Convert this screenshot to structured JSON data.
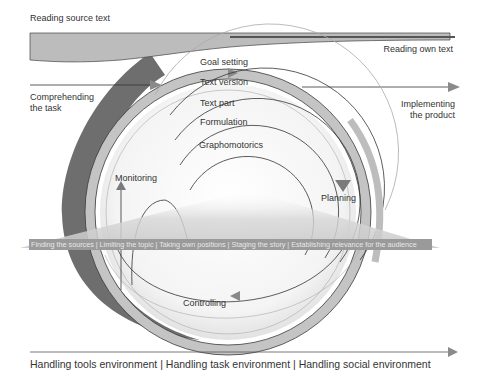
{
  "diagram": {
    "top_left_label": "Reading source text",
    "top_right_label": "Reading own text",
    "left_label": [
      "Comprehending",
      "the task"
    ],
    "right_label": [
      "Implementing",
      "the product"
    ],
    "levels": [
      "Goal setting",
      "Text version",
      "Text part",
      "Formulation",
      "Graphomotorics"
    ],
    "processes": {
      "monitoring": "Monitoring",
      "planning": "Planning",
      "controlling": "Controlling"
    },
    "banner": "Finding the sources | Limiting the topic | Taking own positions | Staging the story | Establishing relevance for the audience",
    "bottom_axis": "Handling tools environment | Handling task environment | Handling social environment",
    "colors": {
      "band_light": "#c4c4c4",
      "band_dark": "#6e6e6e",
      "banner_bg": "#9a9a9a",
      "arrow": "#8a8a8a",
      "line": "#333333"
    }
  }
}
